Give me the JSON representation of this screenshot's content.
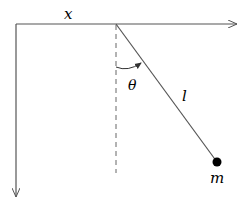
{
  "diagram": {
    "type": "simple-pendulum",
    "labels": {
      "x_axis": "x",
      "angle": "θ",
      "length": "l",
      "mass": "m"
    },
    "colors": {
      "line": "#555555",
      "dashed": "#666666",
      "bob": "#000000",
      "text": "#000000",
      "background": "#ffffff"
    },
    "geometry": {
      "origin": [
        16,
        24
      ],
      "pivot": [
        116,
        24
      ],
      "x_axis_end": [
        237,
        24
      ],
      "y_axis_end": [
        16,
        197
      ],
      "dashed_end": [
        116,
        173
      ],
      "bob_center": [
        217,
        162
      ],
      "bob_radius": 4.5
    }
  }
}
